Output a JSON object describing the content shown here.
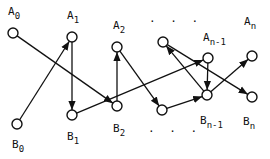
{
  "diagram": {
    "type": "bipartite-directed-graph",
    "nodes": [
      {
        "id": "A0",
        "base": "A",
        "sub": "0"
      },
      {
        "id": "A1",
        "base": "A",
        "sub": "1"
      },
      {
        "id": "A2",
        "base": "A",
        "sub": "2"
      },
      {
        "id": "Adots",
        "base": "",
        "sub": ""
      },
      {
        "id": "An-1",
        "base": "A",
        "sub": "n-1"
      },
      {
        "id": "An",
        "base": "A",
        "sub": "n"
      },
      {
        "id": "B0",
        "base": "B",
        "sub": "0"
      },
      {
        "id": "B1",
        "base": "B",
        "sub": "1"
      },
      {
        "id": "B2",
        "base": "B",
        "sub": "2"
      },
      {
        "id": "Bdots",
        "base": "",
        "sub": ""
      },
      {
        "id": "Bn-1",
        "base": "B",
        "sub": "n-1"
      },
      {
        "id": "Bn",
        "base": "B",
        "sub": "n"
      }
    ],
    "ellipsis_top": ". . .",
    "ellipsis_bottom": ". . .",
    "edges": [
      {
        "from": "A0",
        "to": "B2"
      },
      {
        "from": "B0",
        "to": "A1"
      },
      {
        "from": "A1",
        "to": "B1"
      },
      {
        "from": "B1",
        "to": "An-1"
      },
      {
        "from": "B2",
        "to": "A2"
      },
      {
        "from": "A2",
        "to": "Bdots"
      },
      {
        "from": "Bdots",
        "to": "Bn-1"
      },
      {
        "from": "Bn-1",
        "to": "Adots"
      },
      {
        "from": "Adots",
        "to": "Bn"
      },
      {
        "from": "Bn-1",
        "to": "An"
      },
      {
        "from": "An-1",
        "to": "Bn-1"
      }
    ]
  }
}
